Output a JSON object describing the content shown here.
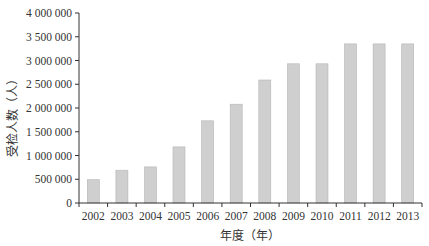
{
  "chart_data": {
    "type": "bar",
    "title": "",
    "xlabel": "年度（年）",
    "ylabel": "受检人数（人）",
    "categories": [
      "2002",
      "2003",
      "2004",
      "2005",
      "2006",
      "2007",
      "2008",
      "2009",
      "2010",
      "2011",
      "2012",
      "2013"
    ],
    "values": [
      490000,
      690000,
      760000,
      1180000,
      1730000,
      2080000,
      2590000,
      2930000,
      2930000,
      3350000,
      3350000,
      3350000
    ],
    "ylim": [
      0,
      4000000
    ],
    "yticks": [
      0,
      500000,
      1000000,
      1500000,
      2000000,
      2500000,
      3000000,
      3500000,
      4000000
    ],
    "ytick_labels": [
      "0",
      "500 000",
      "1 000 000",
      "1 500 000",
      "2 000 000",
      "2 500 000",
      "3 000 000",
      "3 500 000",
      "4 000 000"
    ],
    "grid": false,
    "legend": null,
    "colors": {
      "bar_fill": "#cfcfcf",
      "bar_edge": "#b5b5b5",
      "axis": "#333333"
    }
  }
}
